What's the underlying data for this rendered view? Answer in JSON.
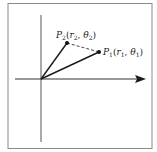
{
  "diagram": {
    "points": [
      {
        "id": "P2",
        "name": "P",
        "subscript": "2",
        "r": "r",
        "r_sub": "2",
        "theta": "θ",
        "theta_sub": "2",
        "x": 67,
        "y": 43
      },
      {
        "id": "P1",
        "name": "P",
        "subscript": "1",
        "r": "r",
        "r_sub": "1",
        "theta": "θ",
        "theta_sub": "1",
        "x": 99,
        "y": 52
      }
    ],
    "origin": {
      "x": 41,
      "y": 79
    },
    "segments": [
      {
        "from": "origin",
        "to": "P2",
        "style": "solid"
      },
      {
        "from": "origin",
        "to": "P1",
        "style": "solid"
      },
      {
        "from": "P2",
        "to": "P1",
        "style": "dashed"
      }
    ],
    "axes": {
      "horizontal": {
        "arrow": true
      },
      "vertical": {
        "arrow": false
      }
    },
    "colors": {
      "line": "#1a1a1a",
      "frame": "#8a8a8a",
      "background": "#ffffff"
    }
  }
}
